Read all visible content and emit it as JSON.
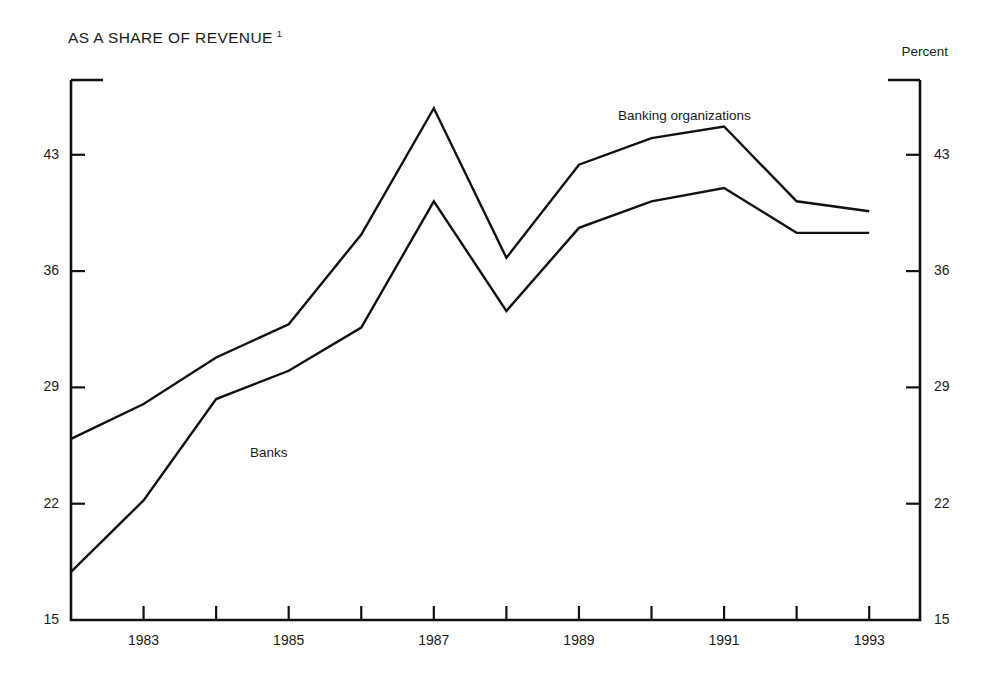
{
  "chart_data": {
    "type": "line",
    "title": "AS A SHARE OF REVENUE",
    "title_footnote": "1",
    "unit_label": "Percent",
    "xlabel": "",
    "ylabel": "Percent",
    "x": [
      1982,
      1983,
      1984,
      1985,
      1986,
      1987,
      1988,
      1989,
      1990,
      1991,
      1992,
      1993
    ],
    "xtick_values": [
      1982,
      1983,
      1984,
      1985,
      1986,
      1987,
      1988,
      1989,
      1990,
      1991,
      1992,
      1993
    ],
    "xtick_labels": [
      "",
      "1983",
      "",
      "1985",
      "",
      "1987",
      "",
      "1989",
      "",
      "1991",
      "",
      "1993"
    ],
    "xlim": [
      1982,
      1993.7
    ],
    "ytick_values": [
      15,
      22,
      29,
      36,
      43
    ],
    "ytick_labels": [
      "15",
      "22",
      "29",
      "36",
      "43"
    ],
    "ylim": [
      15,
      47.5
    ],
    "grid": false,
    "legend_position": "inline-annotations",
    "series": [
      {
        "name": "Banking organizations",
        "label_position": "upper",
        "values": [
          25.9,
          28.0,
          30.8,
          32.8,
          38.2,
          45.8,
          36.8,
          42.4,
          44.0,
          44.7,
          40.2,
          39.6
        ]
      },
      {
        "name": "Banks",
        "label_position": "lower",
        "values": [
          17.9,
          22.2,
          28.3,
          30.0,
          32.6,
          40.2,
          33.6,
          38.6,
          40.2,
          41.0,
          38.3,
          38.3
        ]
      }
    ],
    "annotations": [
      {
        "text": "Banking organizations",
        "series": "Banking organizations"
      },
      {
        "text": "Banks",
        "series": "Banks"
      }
    ],
    "colors": {
      "line": "#111111",
      "background": "#ffffff",
      "text": "#1a1a1a"
    }
  }
}
